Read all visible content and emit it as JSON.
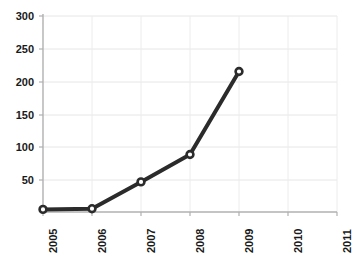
{
  "chart_data": {
    "type": "line",
    "title": "",
    "subtitle": "",
    "xlabel": "",
    "ylabel": "",
    "x": [
      "2005",
      "2006",
      "2007",
      "2008",
      "2009",
      "2010",
      "2011"
    ],
    "categories": [
      "2005",
      "2006",
      "2007",
      "2008",
      "2009",
      "2010",
      "2011"
    ],
    "values": [
      4,
      5,
      46,
      88,
      215,
      null,
      null
    ],
    "series": [
      {
        "name": "series-1",
        "values": [
          4,
          5,
          46,
          88,
          215,
          null,
          null
        ]
      }
    ],
    "xtick_labels": [
      "2005",
      "2006",
      "2007",
      "2008",
      "2009",
      "2010",
      "2011"
    ],
    "ytick_labels": [
      "300",
      "250",
      "200",
      "150",
      "100",
      "50"
    ],
    "yticks": [
      300,
      250,
      200,
      150,
      100,
      50
    ],
    "ylim": [
      0,
      300
    ],
    "xlim": [
      2005,
      2011
    ],
    "grid": true,
    "grid_color": "#e4e4e4",
    "legend": false,
    "legend_position": "none",
    "line_color": "#2b2b2b",
    "marker_face_color": "#ffffff",
    "marker_edge_color": "#2b2b2b",
    "marker": "circle",
    "line_width": 4,
    "axis_color": "#b8b8b8",
    "tick_label_color": "#1a1a1a",
    "xtick_rotation": 90,
    "background_color": "#ffffff",
    "annotations": []
  },
  "axes": {
    "y_tick_labels": [
      {
        "text": "300",
        "value": 300
      },
      {
        "text": "250",
        "value": 250
      },
      {
        "text": "200",
        "value": 200
      },
      {
        "text": "150",
        "value": 150
      },
      {
        "text": "100",
        "value": 100
      },
      {
        "text": "50",
        "value": 50
      }
    ],
    "x_tick_labels": [
      {
        "text": "2005"
      },
      {
        "text": "2006"
      },
      {
        "text": "2007"
      },
      {
        "text": "2008"
      },
      {
        "text": "2009"
      },
      {
        "text": "2010"
      },
      {
        "text": "2011"
      }
    ]
  }
}
